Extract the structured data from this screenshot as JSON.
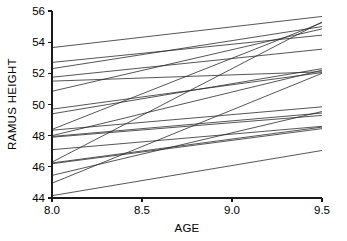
{
  "chart_data": {
    "type": "line",
    "title": "",
    "subtitle": "",
    "xlabel": "AGE",
    "ylabel": "RAMUS HEIGHT",
    "xlim": [
      8.0,
      9.5
    ],
    "ylim": [
      44,
      56
    ],
    "x": [
      8.0,
      9.5
    ],
    "xticks": [
      8.0,
      8.5,
      9.0,
      9.5
    ],
    "xticklabels": [
      "8.0",
      "8.5",
      "9.0",
      "9.5"
    ],
    "yticks": [
      44,
      46,
      48,
      50,
      52,
      54,
      56
    ],
    "yticklabels": [
      "44",
      "46",
      "48",
      "50",
      "52",
      "54",
      "56"
    ],
    "grid": false,
    "legend": false,
    "legend_position": "none",
    "line_color": "#2b2b2b",
    "background_color": "#ffffff",
    "axis_color": "#1a1a1a",
    "series": [
      {
        "name": "subject-1",
        "values": [
          53.65,
          55.65
        ]
      },
      {
        "name": "subject-2",
        "values": [
          52.7,
          54.45
        ]
      },
      {
        "name": "subject-3",
        "values": [
          52.3,
          55.0
        ]
      },
      {
        "name": "subject-4",
        "values": [
          51.75,
          53.55
        ]
      },
      {
        "name": "subject-5",
        "values": [
          51.5,
          52.1
        ]
      },
      {
        "name": "subject-6",
        "values": [
          50.85,
          54.85
        ]
      },
      {
        "name": "subject-7",
        "values": [
          49.7,
          52.05
        ]
      },
      {
        "name": "subject-8",
        "values": [
          49.4,
          52.3
        ]
      },
      {
        "name": "subject-9",
        "values": [
          48.4,
          55.25
        ]
      },
      {
        "name": "subject-10",
        "values": [
          48.35,
          49.85
        ]
      },
      {
        "name": "subject-11",
        "values": [
          48.0,
          52.2
        ]
      },
      {
        "name": "subject-12",
        "values": [
          47.95,
          49.45
        ]
      },
      {
        "name": "subject-13",
        "values": [
          47.9,
          49.3
        ]
      },
      {
        "name": "subject-14",
        "values": [
          47.1,
          48.6
        ]
      },
      {
        "name": "subject-15",
        "values": [
          46.3,
          55.3
        ]
      },
      {
        "name": "subject-16",
        "values": [
          46.25,
          48.55
        ]
      },
      {
        "name": "subject-17",
        "values": [
          46.2,
          48.45
        ]
      },
      {
        "name": "subject-18",
        "values": [
          45.45,
          49.55
        ]
      },
      {
        "name": "subject-19",
        "values": [
          44.95,
          52.0
        ]
      },
      {
        "name": "subject-20",
        "values": [
          44.15,
          47.05
        ]
      }
    ]
  },
  "axes": {
    "x_title": "AGE",
    "y_title": "RAMUS HEIGHT"
  }
}
